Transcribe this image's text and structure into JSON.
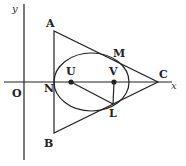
{
  "diagram": {
    "axes": {
      "x_label": "x",
      "y_label": "y",
      "origin_label": "O"
    },
    "points": {
      "A": "A",
      "B": "B",
      "C": "C",
      "M": "M",
      "N": "N",
      "U": "U",
      "V": "V",
      "L": "L"
    },
    "shapes": [
      "triangle ABC",
      "ellipse with foci U and V, tangent to AB at N, tangent to AC at M, tangent to BC at L",
      "segment UL",
      "segment VL"
    ]
  }
}
